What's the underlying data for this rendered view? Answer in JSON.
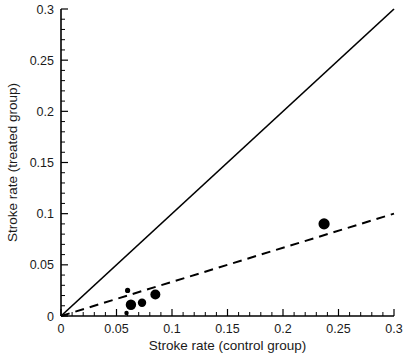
{
  "chart_data": {
    "type": "scatter",
    "title": "",
    "xlabel": "Stroke rate (control group)",
    "ylabel": "Stroke rate (treated group)",
    "xlim": [
      0,
      0.3
    ],
    "ylim": [
      0,
      0.3
    ],
    "xticks": [
      "0",
      "0.05",
      "0.1",
      "0.15",
      "0.2",
      "0.25",
      "0.3"
    ],
    "xtick_values": [
      0,
      0.05,
      0.1,
      0.15,
      0.2,
      0.25,
      0.3
    ],
    "yticks": [
      "0",
      "0.05",
      "0.1",
      "0.15",
      "0.2",
      "0.25",
      "0.3"
    ],
    "ytick_values": [
      0,
      0.05,
      0.1,
      0.15,
      0.2,
      0.25,
      0.3
    ],
    "minor_tick_step": 0.01,
    "grid": false,
    "legend": null,
    "points": [
      {
        "x": 0.059,
        "y": 0.003,
        "size": 2.2
      },
      {
        "x": 0.06,
        "y": 0.025,
        "size": 2.6
      },
      {
        "x": 0.063,
        "y": 0.011,
        "size": 5.2
      },
      {
        "x": 0.073,
        "y": 0.013,
        "size": 4.2
      },
      {
        "x": 0.085,
        "y": 0.021,
        "size": 5.0
      },
      {
        "x": 0.237,
        "y": 0.09,
        "size": 5.6
      }
    ],
    "lines": [
      {
        "name": "identity-line",
        "style": "solid",
        "x": [
          0,
          0.3
        ],
        "y": [
          0,
          0.3
        ]
      },
      {
        "name": "regression-line",
        "style": "dashed",
        "x": [
          0,
          0.3
        ],
        "y": [
          0,
          0.1
        ]
      }
    ],
    "colors": {
      "point": "#000000",
      "line": "#000000",
      "axis": "#000000",
      "background": "#ffffff"
    }
  },
  "axes": {
    "x_title": "Stroke rate (control group)",
    "y_title": "Stroke rate (treated group)"
  }
}
